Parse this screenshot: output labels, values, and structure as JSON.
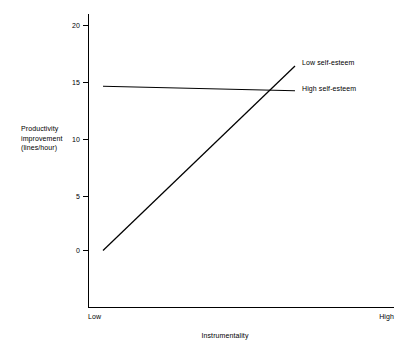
{
  "chart_data": {
    "type": "line",
    "title": "",
    "xlabel": "Instrumentality",
    "ylabel": "Productivity improvement (lines/hour)",
    "ylabel_lines": [
      "Productivity",
      "improvement",
      "(lines/hour)"
    ],
    "xlim_categories": [
      "Low",
      "High"
    ],
    "ylim": [
      0,
      20
    ],
    "yticks": [
      0,
      5,
      10,
      15,
      20
    ],
    "ytick_labels": [
      "0",
      "5",
      "10",
      "15",
      "20"
    ],
    "grid": false,
    "legend_position": "right-inline-end-of-line",
    "x": [
      "Low",
      "High"
    ],
    "series": [
      {
        "name": "Low self-esteem",
        "values": [
          0.0,
          16.4
        ]
      },
      {
        "name": "High self-esteem",
        "values": [
          14.6,
          14.2
        ]
      }
    ],
    "line_color": "#000000",
    "axis_color": "#000000"
  },
  "axes": {
    "y_tick_0": "0",
    "y_tick_5": "5",
    "y_tick_10": "10",
    "y_tick_15": "15",
    "y_tick_20": "20",
    "y_title_line1": "Productivity",
    "y_title_line2": "improvement",
    "y_title_line3": "(lines/hour)",
    "x_title": "Instrumentality",
    "x_cat_low": "Low",
    "x_cat_high": "High"
  },
  "legend": {
    "series_low": "Low self-esteem",
    "series_high": "High self-esteem"
  }
}
